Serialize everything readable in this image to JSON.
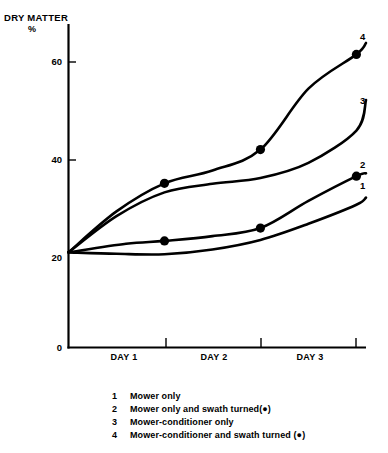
{
  "chart_data": {
    "type": "line",
    "title": "",
    "ylabel": "DRY MATTER",
    "yunit": "%",
    "xlabel": "",
    "ylim": [
      0,
      68
    ],
    "yticks": [
      0,
      20,
      40,
      60
    ],
    "ytick_labels": [
      "0",
      "20",
      "40",
      "60"
    ],
    "xlim": [
      0,
      3.1
    ],
    "xticks": [
      1,
      2,
      3
    ],
    "xtick_labels": [
      "DAY 1",
      "DAY 2",
      "DAY 3"
    ],
    "grid": false,
    "legend_position": "below",
    "marker_note": "filled circle marks swath turned",
    "series": [
      {
        "name": "1",
        "label": "Mower only",
        "end_label": "1",
        "x": [
          0.0,
          0.5,
          1.0,
          1.5,
          2.0,
          2.5,
          3.0,
          3.1
        ],
        "values": [
          20.0,
          19.7,
          19.6,
          20.6,
          22.6,
          26.0,
          30.0,
          31.5
        ],
        "markers": []
      },
      {
        "name": "2",
        "label": "Mower only and swath turned(●)",
        "end_label": "2",
        "x": [
          0.0,
          0.6,
          1.0,
          1.5,
          2.0,
          2.5,
          3.0,
          3.1
        ],
        "values": [
          20.0,
          21.8,
          22.4,
          23.4,
          25.1,
          30.8,
          36.0,
          36.6
        ],
        "markers": [
          {
            "x": 1.0,
            "y": 22.4
          },
          {
            "x": 2.0,
            "y": 25.1
          },
          {
            "x": 3.0,
            "y": 36.0
          }
        ]
      },
      {
        "name": "3",
        "label": "Mower-conditioner only",
        "end_label": "3",
        "x": [
          0.0,
          0.5,
          1.0,
          1.5,
          2.0,
          2.5,
          3.0,
          3.1
        ],
        "values": [
          20.0,
          27.6,
          32.6,
          34.4,
          35.6,
          38.8,
          45.6,
          52.0
        ],
        "markers": []
      },
      {
        "name": "4",
        "label": "Mower-conditioner and swath turned (●)",
        "end_label": "4",
        "x": [
          0.0,
          0.5,
          1.0,
          1.5,
          2.0,
          2.5,
          3.0,
          3.1
        ],
        "values": [
          20.0,
          28.6,
          34.5,
          37.2,
          41.6,
          54.4,
          61.6,
          64.0
        ],
        "markers": [
          {
            "x": 1.0,
            "y": 34.5
          },
          {
            "x": 2.0,
            "y": 41.6
          },
          {
            "x": 3.0,
            "y": 61.6
          }
        ]
      }
    ]
  },
  "legend": {
    "rows": [
      {
        "key": "1",
        "text": "Mower only"
      },
      {
        "key": "2",
        "text": "Mower only and swath turned(●)"
      },
      {
        "key": "3",
        "text": "Mower-conditioner only"
      },
      {
        "key": "4",
        "text": "Mower-conditioner and swath turned (●)"
      }
    ]
  },
  "colors": {
    "ink": "#000000",
    "background": "#ffffff"
  }
}
